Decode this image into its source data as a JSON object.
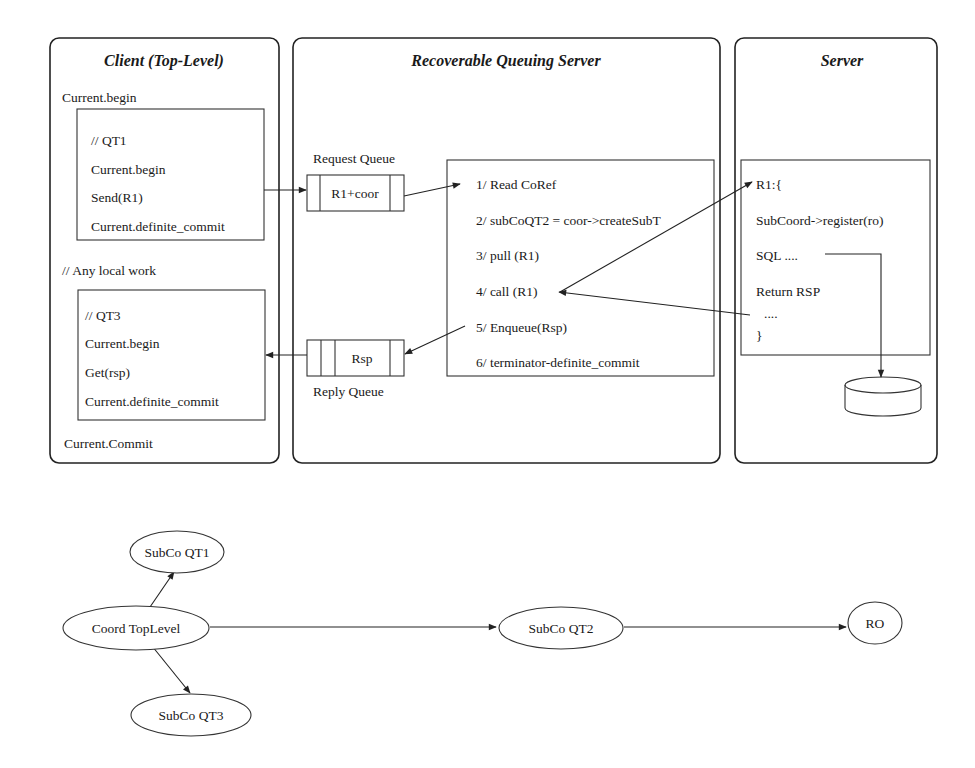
{
  "client": {
    "title": "Client (Top-Level)",
    "begin": "Current.begin",
    "qt1": [
      "// QT1",
      "Current.begin",
      "Send(R1)",
      "Current.definite_commit"
    ],
    "local_work": "// Any local work",
    "qt3": [
      "// QT3",
      "Current.begin",
      "Get(rsp)",
      "Current.definite_commit"
    ],
    "commit": "Current.Commit"
  },
  "rqs": {
    "title": "Recoverable Queuing Server",
    "request_queue_label": "Request Queue",
    "request_queue_item": "R1+coor",
    "reply_queue_label": "Reply Queue",
    "reply_queue_item": "Rsp",
    "steps": [
      "1/ Read CoRef",
      "2/ subCoQT2 = coor->createSubT",
      "3/ pull (R1)",
      "4/ call (R1)",
      "5/ Enqueue(Rsp)",
      "6/ terminator-definite_commit"
    ]
  },
  "server": {
    "title": "Server",
    "code": [
      "R1:{",
      "SubCoord->register(ro)",
      "SQL ....",
      "Return RSP",
      "....",
      "}"
    ],
    "database_icon": "database-cylinder-icon"
  },
  "tree": {
    "nodes": {
      "root": "Coord TopLevel",
      "qt1": "SubCo QT1",
      "qt2": "SubCo QT2",
      "qt3": "SubCo QT3",
      "ro": "RO"
    },
    "edges": [
      [
        "Coord TopLevel",
        "SubCo QT1"
      ],
      [
        "Coord TopLevel",
        "SubCo QT3"
      ],
      [
        "Coord TopLevel",
        "SubCo QT2"
      ],
      [
        "SubCo QT2",
        "RO"
      ]
    ]
  }
}
